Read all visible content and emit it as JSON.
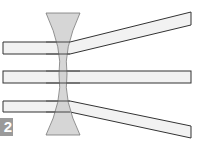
{
  "figure": {
    "label": "2",
    "colors": {
      "lens_fill": "#d4d4d4",
      "beam_fill": "#f2f2f2",
      "stroke": "#333333",
      "label_bg": "#9a9a9a",
      "label_text": "#ffffff"
    },
    "lens": {
      "type": "concave",
      "top_y": 13,
      "bottom_y": 135,
      "left_x": 46,
      "right_x": 80
    },
    "beams": [
      {
        "name": "top",
        "behavior": "diverges upward"
      },
      {
        "name": "middle",
        "behavior": "passes straight through"
      },
      {
        "name": "bottom",
        "behavior": "diverges downward"
      }
    ]
  }
}
